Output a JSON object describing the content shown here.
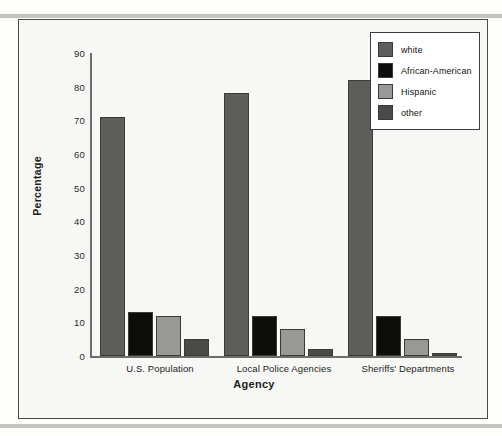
{
  "chart_data": {
    "type": "bar",
    "title": "",
    "xlabel": "Agency",
    "ylabel": "Percentage",
    "categories": [
      "U.S. Population",
      "Local Police Agencies",
      "Sheriffs' Departments"
    ],
    "yticks": [
      90,
      80,
      70,
      60,
      50,
      40,
      30,
      20,
      10,
      0
    ],
    "ylim": [
      0,
      90
    ],
    "grid": false,
    "legend_position": "top-right",
    "series": [
      {
        "name": "white",
        "color": "#5d5d5b",
        "values": [
          71,
          78,
          82
        ]
      },
      {
        "name": "African-American",
        "color": "#0d0d0c",
        "values": [
          13,
          12,
          12
        ]
      },
      {
        "name": "Hispanic",
        "color": "#989896",
        "values": [
          12,
          8,
          5
        ]
      },
      {
        "name": "other",
        "color": "#4a4a48",
        "values": [
          5,
          2,
          1
        ]
      }
    ]
  },
  "figure": {
    "background": "#f7f7f5",
    "frame_color": "#4a4a48",
    "axis_color": "#6d6d6b"
  }
}
